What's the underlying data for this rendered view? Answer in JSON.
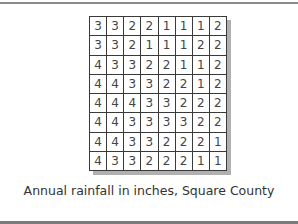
{
  "figure": {
    "caption": "Annual rainfall in inches, Square County",
    "grid": [
      [
        3,
        3,
        2,
        2,
        1,
        1,
        1,
        2
      ],
      [
        3,
        3,
        2,
        1,
        1,
        1,
        2,
        2
      ],
      [
        4,
        3,
        3,
        2,
        2,
        1,
        1,
        2
      ],
      [
        4,
        4,
        3,
        3,
        2,
        2,
        1,
        2
      ],
      [
        4,
        4,
        4,
        3,
        3,
        2,
        2,
        2
      ],
      [
        4,
        4,
        3,
        3,
        3,
        3,
        2,
        2
      ],
      [
        4,
        4,
        3,
        3,
        2,
        2,
        2,
        1
      ],
      [
        4,
        3,
        3,
        2,
        2,
        2,
        1,
        1
      ]
    ],
    "rows": 8,
    "cols": 8
  }
}
